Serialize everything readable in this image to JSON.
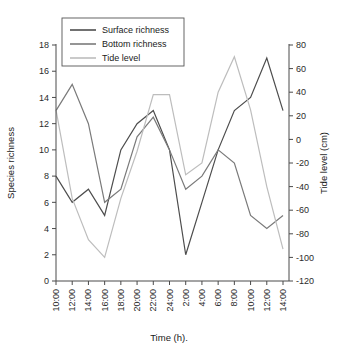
{
  "figure": {
    "background": "#ffffff",
    "xlabel": "Time (h).",
    "ylabel_left": "Species richness",
    "ylabel_right": "Tide level (cm)"
  },
  "legend": {
    "position": "top-left",
    "items": [
      {
        "label": "Surface richness",
        "color": "#4d4d4d"
      },
      {
        "label": "Bottom richness",
        "color": "#7a7a7a"
      },
      {
        "label": "Tide level",
        "color": "#bdbdbd"
      }
    ]
  },
  "axes": {
    "x_ticks": [
      "10:00",
      "12:00",
      "14:00",
      "16:00",
      "18:00",
      "20:00",
      "22:00",
      "24:00",
      "2:00",
      "4:00",
      "6:00",
      "8:00",
      "10:00",
      "12:00",
      "14:00"
    ],
    "y_left_ticks": [
      0,
      2,
      4,
      6,
      8,
      10,
      12,
      14,
      16,
      18
    ],
    "y_right_ticks": [
      80,
      60,
      40,
      20,
      0,
      -20,
      -40,
      -60,
      -80,
      -100,
      -120
    ],
    "y_left_range": [
      0,
      18
    ],
    "y_right_range": [
      -120,
      80
    ]
  },
  "chart_data": {
    "type": "line",
    "title": "",
    "xlabel": "Time (h).",
    "ylabel": "Species richness",
    "ylabel_secondary": "Tide level (cm)",
    "grid": false,
    "legend_position": "top-left",
    "categories": [
      "10:00",
      "12:00",
      "14:00",
      "16:00",
      "18:00",
      "20:00",
      "22:00",
      "24:00",
      "2:00",
      "4:00",
      "6:00",
      "8:00",
      "10:00",
      "12:00",
      "14:00"
    ],
    "ylim": [
      0,
      18
    ],
    "ylim_secondary": [
      -120,
      80
    ],
    "series": [
      {
        "name": "Surface richness",
        "axis": "left",
        "color": "#4d4d4d",
        "units": "species",
        "values": [
          8,
          6,
          7,
          5,
          10,
          12,
          13,
          10,
          2,
          6,
          10,
          13,
          14,
          17,
          13
        ]
      },
      {
        "name": "Bottom richness",
        "axis": "left",
        "color": "#7a7a7a",
        "units": "species",
        "values": [
          13,
          15,
          12,
          6,
          7,
          11,
          12.5,
          10,
          7,
          8,
          10,
          9,
          5,
          4,
          5
        ]
      },
      {
        "name": "Tide level",
        "axis": "right",
        "color": "#bdbdbd",
        "units": "cm",
        "values": [
          25,
          -50,
          -85,
          -100,
          -50,
          -10,
          38,
          38,
          -30,
          -20,
          40,
          70,
          25,
          -40,
          -93
        ]
      }
    ]
  }
}
